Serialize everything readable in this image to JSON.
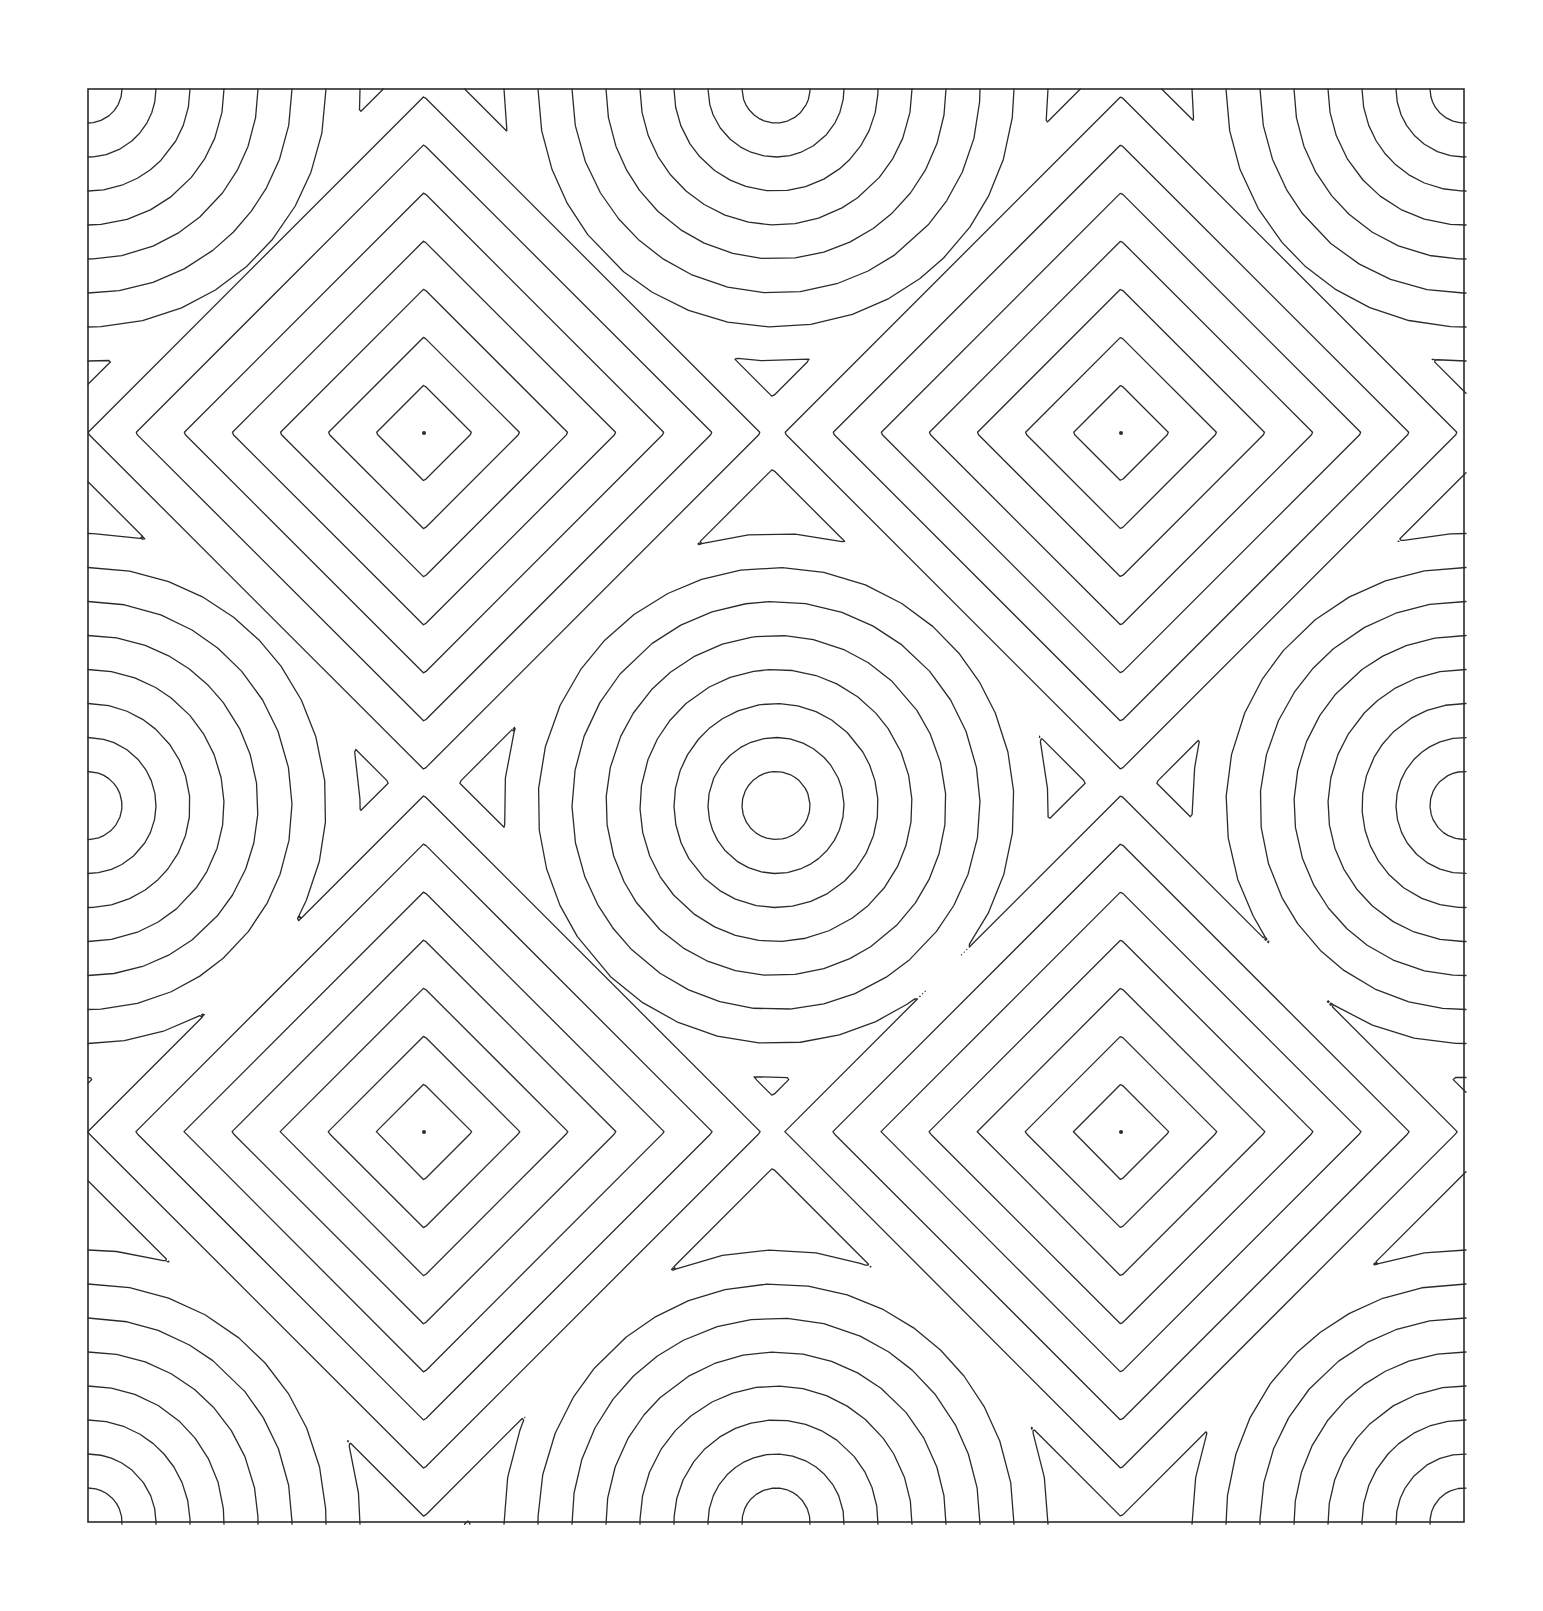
{
  "figure": {
    "canvas": {
      "width": 1543,
      "height": 1611,
      "background": "#ffffff"
    },
    "frame": {
      "name": "plot-border",
      "x": 88,
      "y": 89,
      "width": 1376,
      "height": 1433,
      "stroke": "#2b2b2b",
      "stroke_width": 1.6,
      "fill": "none"
    },
    "line_style": {
      "stroke": "#2b2b2b",
      "stroke_width": 1.3,
      "fill": "none"
    },
    "center_dot": {
      "radius": 2.0,
      "fill": "#2b2b2b"
    }
  },
  "chart_data": {
    "type": "line",
    "subtitle": "Alternating Euclidean (circular) and Chebyshev (diamond) metrics",
    "xlabel": "",
    "ylabel": "",
    "grid": false,
    "legend": null,
    "xlim": [
      88,
      1464
    ],
    "ylim": [
      89,
      1522
    ],
    "contour_interval": 34.0,
    "max_contour_level": 520,
    "sample_step": 2.6,
    "lattice": {
      "cols": 3,
      "rows": 3,
      "x_positions": [
        88,
        776,
        1464
      ],
      "y_positions": [
        89,
        805.5,
        1522
      ],
      "dx": 688,
      "dy": 716.5
    },
    "seeds": [
      {
        "id": "s00",
        "x": 88,
        "y": 89,
        "metric": "euclidean",
        "role": "corner-ring-center"
      },
      {
        "id": "s10",
        "x": 776,
        "y": 89,
        "metric": "euclidean",
        "role": "edge-ring-center"
      },
      {
        "id": "s20",
        "x": 1464,
        "y": 89,
        "metric": "euclidean",
        "role": "corner-ring-center"
      },
      {
        "id": "s01",
        "x": 88,
        "y": 805.5,
        "metric": "euclidean",
        "role": "edge-ring-center"
      },
      {
        "id": "s11",
        "x": 776,
        "y": 805.5,
        "metric": "euclidean",
        "role": "center-ring-center"
      },
      {
        "id": "s21",
        "x": 1464,
        "y": 805.5,
        "metric": "euclidean",
        "role": "edge-ring-center"
      },
      {
        "id": "s02",
        "x": 88,
        "y": 1522,
        "metric": "euclidean",
        "role": "corner-ring-center"
      },
      {
        "id": "s12",
        "x": 776,
        "y": 1522,
        "metric": "euclidean",
        "role": "edge-ring-center"
      },
      {
        "id": "s22",
        "x": 1464,
        "y": 1522,
        "metric": "euclidean",
        "role": "corner-ring-center"
      },
      {
        "id": "d00",
        "x": 424,
        "y": 433,
        "metric": "chebyshev",
        "role": "diamond-center"
      },
      {
        "id": "d10",
        "x": 1121,
        "y": 433,
        "metric": "chebyshev",
        "role": "diamond-center"
      },
      {
        "id": "d01",
        "x": 424,
        "y": 1132,
        "metric": "chebyshev",
        "role": "diamond-center"
      },
      {
        "id": "d11",
        "x": 1121,
        "y": 1132,
        "metric": "chebyshev",
        "role": "diamond-center"
      }
    ],
    "center_markers": [
      {
        "x": 424,
        "y": 433
      },
      {
        "x": 1121,
        "y": 433
      },
      {
        "x": 424,
        "y": 1132
      },
      {
        "x": 1121,
        "y": 1132
      }
    ]
  }
}
